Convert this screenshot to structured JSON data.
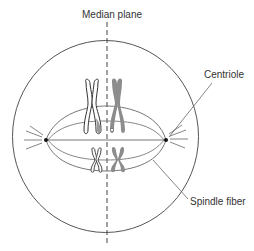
{
  "labels": {
    "median_plane": "Median plane",
    "centriole": "Centriole",
    "spindle_fiber": "Spindle fiber"
  },
  "colors": {
    "line": "#4a4a4a",
    "light_line": "#7a7a7a",
    "chromosome_gray": "#8c8c8c",
    "chromosome_outline": "#333333",
    "centriole": "#111111",
    "background": "#ffffff"
  },
  "figure": {
    "cell": {
      "cx": 105.5,
      "cy": 136.5,
      "rx": 93,
      "ry": 96
    },
    "centrioles": [
      {
        "x": 46,
        "y": 140
      },
      {
        "x": 166,
        "y": 140
      }
    ],
    "median_plane_x": 107
  }
}
